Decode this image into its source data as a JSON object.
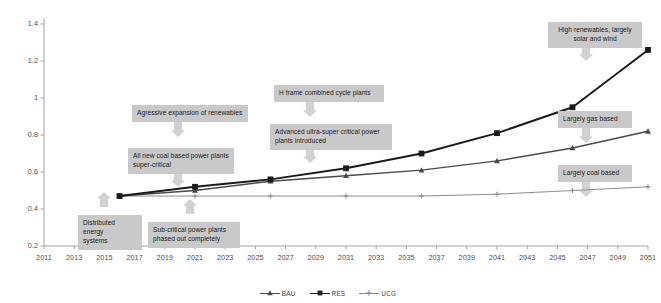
{
  "chart_data": {
    "type": "line",
    "title": "",
    "xlabel": "",
    "ylabel": "",
    "grid": false,
    "legend_position": "bottom-center",
    "x_ticks": [
      "2011",
      "2013",
      "2015",
      "2017",
      "2019",
      "2021",
      "2023",
      "2025",
      "2027",
      "2029",
      "2031",
      "2033",
      "2035",
      "2037",
      "2039",
      "2041",
      "2043",
      "2045",
      "2047",
      "2049",
      "2051"
    ],
    "y_ticks": [
      "0.2",
      "0.4",
      "0.6",
      "0.8",
      "1",
      "1.2",
      "1.4"
    ],
    "xlim": [
      2011,
      2051
    ],
    "ylim": [
      0.2,
      1.4
    ],
    "x": [
      2016,
      2021,
      2026,
      2031,
      2036,
      2041,
      2046,
      2051
    ],
    "series": [
      {
        "name": "BAU",
        "color": "#4a4a4a",
        "marker": "triangle",
        "values": [
          0.47,
          0.5,
          0.55,
          0.58,
          0.61,
          0.66,
          0.73,
          0.82
        ]
      },
      {
        "name": "RES",
        "color": "#1a1a1a",
        "marker": "square",
        "values": [
          0.47,
          0.52,
          0.56,
          0.62,
          0.7,
          0.81,
          0.95,
          1.26
        ]
      },
      {
        "name": "UCG",
        "color": "#8c8c8c",
        "marker": "cross",
        "values": [
          0.47,
          0.47,
          0.47,
          0.47,
          0.47,
          0.48,
          0.5,
          0.52
        ]
      }
    ],
    "annotations": [
      {
        "id": "distributed-energy-systems",
        "text": "Distributed energy\nsystems",
        "align": "left",
        "x": 78,
        "y": 215,
        "w": 64,
        "arrow_x": 104,
        "arrow_y": 207,
        "arrow_dir": "up"
      },
      {
        "id": "sub-critical-phased-out",
        "text": "Sub-critical  power plants\nphased out completely",
        "align": "left",
        "x": 148,
        "y": 222,
        "w": 92,
        "arrow_x": 190,
        "arrow_y": 214,
        "arrow_dir": "up"
      },
      {
        "id": "all-new-coal-super-critical",
        "text": "All new coal based power plants\nsuper-critical",
        "align": "left",
        "x": 128,
        "y": 148,
        "w": 106,
        "arrow_x": 178,
        "arrow_y": 172,
        "arrow_dir": "down"
      },
      {
        "id": "agressive-expansion-renewables",
        "text": "Agressive expansion of renewables",
        "align": "left",
        "x": 132,
        "y": 105,
        "w": 116,
        "arrow_x": 178,
        "arrow_y": 122,
        "arrow_dir": "down"
      },
      {
        "id": "h-frame-combined-cycle",
        "text": "H frame combined cycle plants",
        "align": "left",
        "x": 274,
        "y": 85,
        "w": 110,
        "arrow_x": 310,
        "arrow_y": 102,
        "arrow_dir": "down"
      },
      {
        "id": "advanced-ultra-super-critical",
        "text": "Advanced ultra-super critical power\nplants introduced",
        "align": "left",
        "x": 270,
        "y": 124,
        "w": 122,
        "arrow_x": 310,
        "arrow_y": 148,
        "arrow_dir": "down"
      },
      {
        "id": "high-renewables-solar-wind",
        "text": "High renewables, largely\nsolar and wind",
        "align": "center",
        "x": 548,
        "y": 22,
        "w": 94,
        "arrow_x": 586,
        "arrow_y": 46,
        "arrow_dir": "down"
      },
      {
        "id": "largely-gas-based",
        "text": "Largely gas based",
        "align": "left",
        "x": 558,
        "y": 111,
        "w": 74,
        "arrow_x": 586,
        "arrow_y": 128,
        "arrow_dir": "down"
      },
      {
        "id": "largely-coal-based",
        "text": "Largely coal based",
        "align": "left",
        "x": 558,
        "y": 165,
        "w": 74,
        "arrow_x": 586,
        "arrow_y": 182,
        "arrow_dir": "down"
      }
    ]
  },
  "legend": {
    "items": [
      {
        "label": "BAU"
      },
      {
        "label": "RES"
      },
      {
        "label": "UCG"
      }
    ]
  },
  "colors": {
    "axis": "#9b9b9b",
    "tick_text": "#4c4c4c",
    "annotation_bg": "#c9c9c9",
    "annotation_text": "#1a1a1a",
    "arrow": "#d2d2d2",
    "background": "#ffffff"
  }
}
